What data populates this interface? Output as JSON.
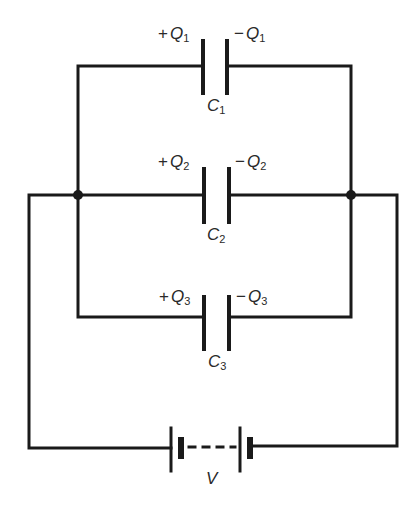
{
  "diagram": {
    "type": "circuit",
    "stroke_color": "#1a1a1a",
    "components": [
      {
        "id": "C1",
        "label": "C",
        "sub": "1",
        "left_charge": {
          "sign": "+",
          "sym": "Q",
          "sub": "1"
        },
        "right_charge": {
          "sign": "−",
          "sym": "Q",
          "sub": "1"
        }
      },
      {
        "id": "C2",
        "label": "C",
        "sub": "2",
        "left_charge": {
          "sign": "+",
          "sym": "Q",
          "sub": "2"
        },
        "right_charge": {
          "sign": "−",
          "sym": "Q",
          "sub": "2"
        }
      },
      {
        "id": "C3",
        "label": "C",
        "sub": "3",
        "left_charge": {
          "sign": "+",
          "sym": "Q",
          "sub": "3"
        },
        "right_charge": {
          "sign": "−",
          "sym": "Q",
          "sub": "3"
        }
      }
    ],
    "battery": {
      "label": "V"
    }
  }
}
